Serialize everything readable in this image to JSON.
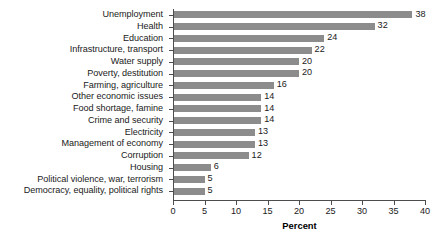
{
  "chart_data": {
    "type": "bar",
    "orientation": "horizontal",
    "title": "",
    "subtitle": "",
    "xlabel": "Percent",
    "ylabel": "",
    "xlim": [
      0,
      40
    ],
    "grid": false,
    "legend": null,
    "bar_color": "#8c8c8c",
    "axis_color": "#4d4d4d",
    "background_color": "#ffffff",
    "x_ticks": [
      0,
      5,
      10,
      15,
      20,
      25,
      30,
      35,
      40
    ],
    "x_tick_labels": [
      "0",
      "5",
      "10",
      "15",
      "20",
      "25",
      "30",
      "35",
      "40"
    ],
    "categories": [
      "Unemployment",
      "Health",
      "Education",
      "Infrastructure, transport",
      "Water supply",
      "Poverty, destitution",
      "Farming, agriculture",
      "Other economic issues",
      "Food shortage, famine",
      "Crime and security",
      "Electricity",
      "Management of economy",
      "Corruption",
      "Housing",
      "Political violence, war, terrorism",
      "Democracy, equality, political rights"
    ],
    "values": [
      38,
      32,
      24,
      22,
      20,
      20,
      16,
      14,
      14,
      14,
      13,
      13,
      12,
      6,
      5,
      5
    ],
    "value_labels": [
      "38",
      "32",
      "24",
      "22",
      "20",
      "20",
      "16",
      "14",
      "14",
      "14",
      "13",
      "13",
      "12",
      "6",
      "5",
      "5"
    ]
  }
}
